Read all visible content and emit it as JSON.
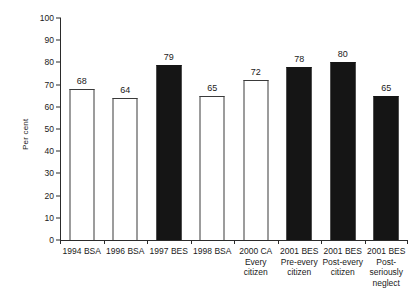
{
  "chart_data": {
    "type": "bar",
    "title": "",
    "xlabel": "",
    "ylabel": "Per cent",
    "ylim": [
      0,
      100
    ],
    "ytick_step": 10,
    "yticks": [
      0,
      10,
      20,
      30,
      40,
      50,
      60,
      70,
      80,
      90,
      100
    ],
    "grid": false,
    "legend": "none",
    "categories": [
      "1994 BSA",
      "1996 BSA",
      "1997 BES",
      "1998 BSA",
      "2000 CA Every citizen",
      "2001 BES Pre-every citizen",
      "2001 BES Post-every citizen",
      "2001 BES Post-seriously neglect"
    ],
    "values": [
      68,
      64,
      79,
      65,
      72,
      78,
      80,
      65
    ],
    "bar_styles": [
      "open",
      "open",
      "filled",
      "open",
      "open",
      "filled",
      "filled",
      "filled"
    ],
    "bars": [
      {
        "label_lines": [
          "1994 BSA"
        ],
        "value": 68,
        "style": "open"
      },
      {
        "label_lines": [
          "1996 BSA"
        ],
        "value": 64,
        "style": "open"
      },
      {
        "label_lines": [
          "1997 BES"
        ],
        "value": 79,
        "style": "filled"
      },
      {
        "label_lines": [
          "1998 BSA"
        ],
        "value": 65,
        "style": "open"
      },
      {
        "label_lines": [
          "2000 CA",
          "Every",
          "citizen"
        ],
        "value": 72,
        "style": "open"
      },
      {
        "label_lines": [
          "2001 BES",
          "Pre-every",
          "citizen"
        ],
        "value": 78,
        "style": "filled"
      },
      {
        "label_lines": [
          "2001 BES",
          "Post-every",
          "citizen"
        ],
        "value": 80,
        "style": "filled"
      },
      {
        "label_lines": [
          "2001 BES",
          "Post-",
          "seriously",
          "neglect"
        ],
        "value": 65,
        "style": "filled"
      }
    ],
    "colors": {
      "axis": "#2b2b2b",
      "bar_open_fill": "#ffffff",
      "bar_open_stroke": "#3a3a3a",
      "bar_filled_fill": "#151515",
      "background": "#ffffff",
      "text": "#1a1a1a"
    }
  },
  "axis": {
    "y_title": "Per cent",
    "y_labels": [
      "100",
      "90",
      "80",
      "70",
      "60",
      "50",
      "40",
      "30",
      "20",
      "10",
      "0"
    ]
  },
  "bar_value_labels": [
    "68",
    "64",
    "79",
    "65",
    "72",
    "78",
    "80",
    "65"
  ],
  "x_labels": [
    {
      "l1": "1994 BSA",
      "l2": "",
      "l3": "",
      "l4": ""
    },
    {
      "l1": "1996 BSA",
      "l2": "",
      "l3": "",
      "l4": ""
    },
    {
      "l1": "1997 BES",
      "l2": "",
      "l3": "",
      "l4": ""
    },
    {
      "l1": "1998 BSA",
      "l2": "",
      "l3": "",
      "l4": ""
    },
    {
      "l1": "2000 CA",
      "l2": "Every",
      "l3": "citizen",
      "l4": ""
    },
    {
      "l1": "2001 BES",
      "l2": "Pre-every",
      "l3": "citizen",
      "l4": ""
    },
    {
      "l1": "2001 BES",
      "l2": "Post-every",
      "l3": "citizen",
      "l4": ""
    },
    {
      "l1": "2001 BES",
      "l2": "Post-",
      "l3": "seriously",
      "l4": "neglect"
    }
  ],
  "caption": ""
}
